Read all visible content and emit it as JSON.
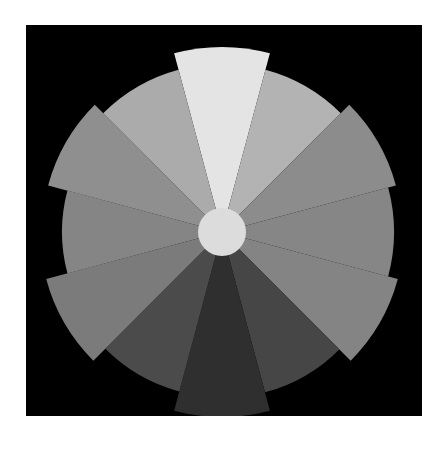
{
  "chart_data": {
    "type": "polar-area",
    "title": "",
    "background": "#000000",
    "center_hub_color": "#dcdcdc",
    "start_angle_deg": -105,
    "sector_width_deg": 30,
    "direction": "clockwise",
    "max_radius_px": 185,
    "sectors": [
      {
        "index": 1,
        "value": 185,
        "color": "#e4e4e4"
      },
      {
        "index": 2,
        "value": 168,
        "color": "#b3b3b3"
      },
      {
        "index": 3,
        "value": 180,
        "color": "#8c8c8c"
      },
      {
        "index": 4,
        "value": 172,
        "color": "#868686"
      },
      {
        "index": 5,
        "value": 182,
        "color": "#848484"
      },
      {
        "index": 6,
        "value": 166,
        "color": "#464646"
      },
      {
        "index": 7,
        "value": 185,
        "color": "#2f2f2f"
      },
      {
        "index": 8,
        "value": 165,
        "color": "#4b4b4b"
      },
      {
        "index": 9,
        "value": 182,
        "color": "#7b7b7b"
      },
      {
        "index": 10,
        "value": 160,
        "color": "#858585"
      },
      {
        "index": 11,
        "value": 180,
        "color": "#8f8f8f"
      },
      {
        "index": 12,
        "value": 168,
        "color": "#ababab"
      }
    ],
    "hub_radius_px": 24,
    "axis_labels": [],
    "legend": []
  }
}
